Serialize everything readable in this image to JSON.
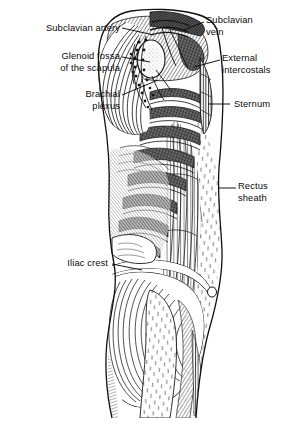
{
  "figure": {
    "style": "black-and-white engraving / pen-and-ink hatching",
    "background_color": "#ffffff",
    "ink_color": "#1a1a1a",
    "view": "right lateral view of thorax, abdomen and hip"
  },
  "labels": [
    {
      "id": "subclavian-artery",
      "text": "Subclavian artery",
      "align": "right",
      "x": 14,
      "y": 22,
      "width": 106,
      "leader": {
        "x1": 122,
        "y1": 28,
        "x2": 152,
        "y2": 34
      }
    },
    {
      "id": "glenoid-fossa",
      "text": "Glenoid fossa\nof the scapula",
      "align": "right",
      "x": 10,
      "y": 50,
      "width": 110,
      "leader": {
        "x1": 122,
        "y1": 56,
        "x2": 150,
        "y2": 62
      }
    },
    {
      "id": "brachial-plexus",
      "text": "Brachial\nplexus",
      "align": "right",
      "x": 30,
      "y": 88,
      "width": 90,
      "leader": {
        "x1": 122,
        "y1": 94,
        "x2": 156,
        "y2": 80
      }
    },
    {
      "id": "subclavian-vein",
      "text": "Subclavian\nvein",
      "align": "left",
      "x": 206,
      "y": 14,
      "width": 84,
      "leader": {
        "x1": 204,
        "y1": 22,
        "x2": 186,
        "y2": 30
      }
    },
    {
      "id": "external-intercostals",
      "text": "External\nintercostals",
      "align": "left",
      "x": 222,
      "y": 52,
      "width": 72,
      "leader": {
        "x1": 220,
        "y1": 60,
        "x2": 196,
        "y2": 66
      }
    },
    {
      "id": "sternum",
      "text": "Sternum",
      "align": "left",
      "x": 234,
      "y": 100,
      "width": 60,
      "leader": {
        "x1": 228,
        "y1": 104,
        "x2": 208,
        "y2": 104
      }
    },
    {
      "id": "rectus-sheath",
      "text": "Rectus\nsheath",
      "align": "left",
      "x": 238,
      "y": 180,
      "width": 56,
      "leader": {
        "x1": 234,
        "y1": 188,
        "x2": 218,
        "y2": 188
      }
    },
    {
      "id": "iliac-crest",
      "text": "Iliac crest",
      "align": "right",
      "x": 34,
      "y": 259,
      "width": 74,
      "leader": {
        "x1": 112,
        "y1": 264,
        "x2": 142,
        "y2": 270
      }
    }
  ]
}
